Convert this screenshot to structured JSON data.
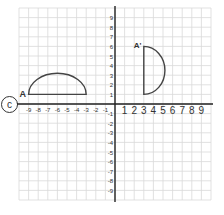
{
  "question_marker": "c",
  "grid": {
    "x_min": -10,
    "x_max": 10,
    "y_min": -10,
    "y_max": 10,
    "origin_px": [
      115,
      104
    ],
    "unit_px": 9.6,
    "x_tick_labels": [
      "-9",
      "-8",
      "-7",
      "-6",
      "-5",
      "-4",
      "-3",
      "-2",
      "-1",
      "1",
      "2",
      "3",
      "4",
      "5",
      "6",
      "7",
      "8",
      "9"
    ],
    "y_tick_labels": [
      "9",
      "8",
      "7",
      "6",
      "5",
      "4",
      "3",
      "2",
      "1",
      "-1",
      "-2",
      "-3",
      "-4",
      "-5",
      "-6",
      "-7",
      "-8",
      "-9"
    ]
  },
  "shapes": {
    "original": {
      "label": "A",
      "base_from": [
        -9,
        1
      ],
      "base_to": [
        -3,
        1
      ],
      "apex": [
        -6,
        3.2
      ]
    },
    "image": {
      "label": "A'",
      "base_from": [
        3,
        6
      ],
      "base_to": [
        3,
        1
      ],
      "apex": [
        5.2,
        3.5
      ]
    }
  },
  "colors": {
    "grid": "#d9d9d9",
    "axis": "#222222",
    "shape": "#444444",
    "text": "#333333"
  }
}
